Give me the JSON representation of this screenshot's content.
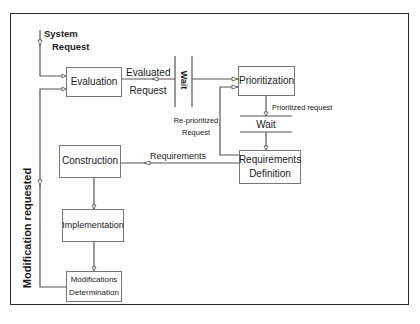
{
  "diagram": {
    "type": "process-flow",
    "nodes": {
      "evaluation": "Evaluation",
      "prioritization": "Prioritization",
      "requirements_definition": [
        "Requirements",
        "Definition"
      ],
      "construction": "Construction",
      "implementation": "Implementation",
      "modifications_determination": [
        "Modifications",
        "Determination"
      ]
    },
    "waits": {
      "wait_vertical": "Wait",
      "wait_horizontal": "Wait"
    },
    "edge_labels": {
      "system_request": [
        "System",
        "Request"
      ],
      "evaluated_request": [
        "Evaluated",
        "Request"
      ],
      "reprioritized_request": [
        "Re-prioritized",
        "Request"
      ],
      "prioritized_request": "Prioritized request",
      "requirements": "Requirements",
      "modification_requested": "Modification requested"
    },
    "edges": [
      {
        "from": "System Request",
        "to": "Evaluation"
      },
      {
        "from": "Evaluation",
        "to": "Wait",
        "label": "Evaluated Request"
      },
      {
        "from": "Wait",
        "to": "Prioritization"
      },
      {
        "from": "Prioritization",
        "to": "Wait",
        "label": "Prioritized request"
      },
      {
        "from": "Wait",
        "to": "Requirements Definition"
      },
      {
        "from": "Requirements Definition",
        "to": "Prioritization",
        "label": "Re-prioritized Request"
      },
      {
        "from": "Requirements Definition",
        "to": "Construction",
        "label": "Requirements"
      },
      {
        "from": "Construction",
        "to": "Implementation"
      },
      {
        "from": "Implementation",
        "to": "Modifications Determination"
      },
      {
        "from": "Modifications Determination",
        "to": "Evaluation",
        "label": "Modification requested"
      }
    ],
    "colors": {
      "line": "#555555",
      "frame": "#2b2b2b",
      "text": "#1a1a1a"
    }
  }
}
